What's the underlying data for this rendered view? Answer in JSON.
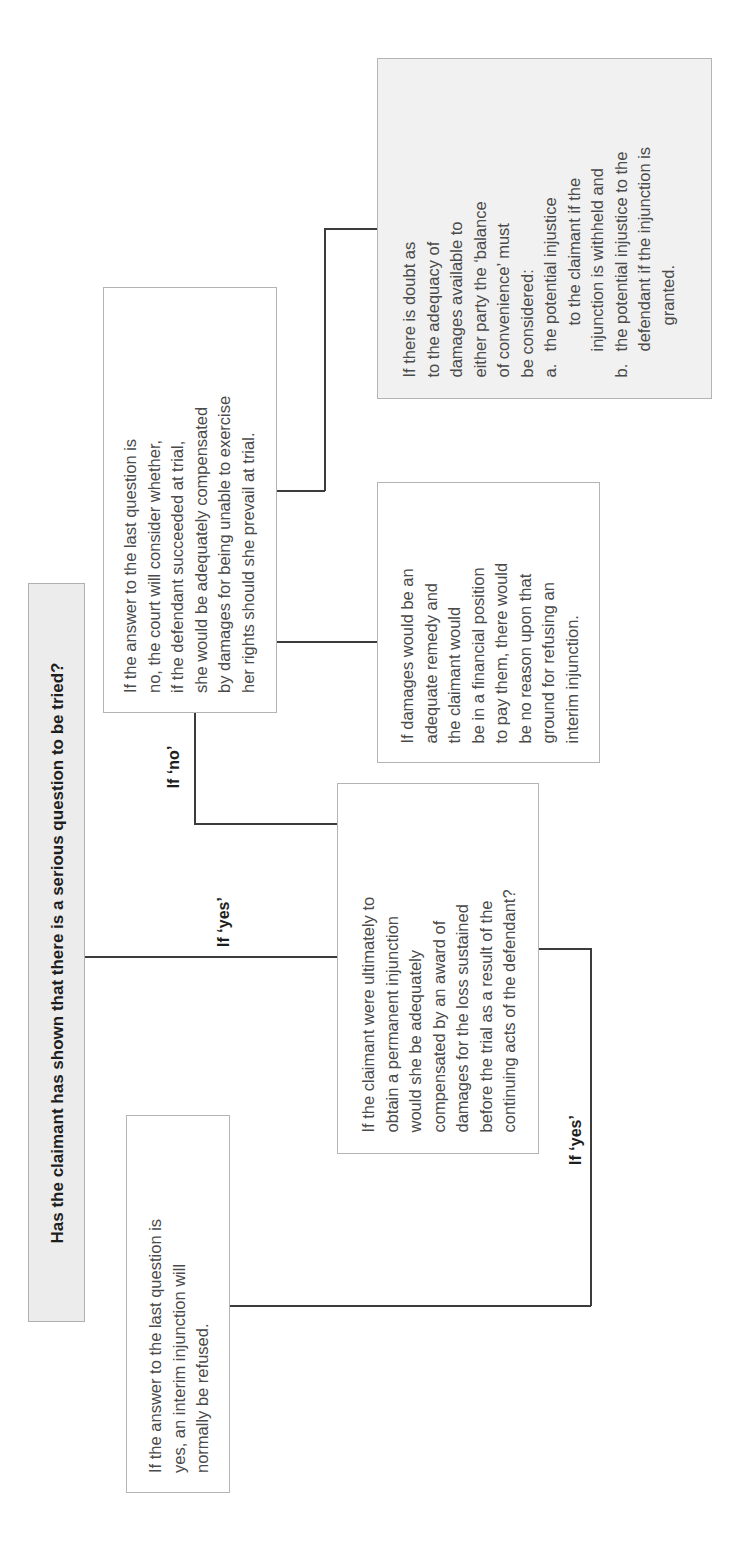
{
  "diagram": {
    "orientation": "rotated 90 degrees counter-clockwise; text reads bottom-to-top",
    "title": "Has the claimant has shown that there is a serious question to be tried?",
    "branch_labels": {
      "title_to_question": "If ‘yes’",
      "question_to_no_box": "If ‘no’",
      "question_to_refused": "If ‘yes’"
    },
    "boxes": {
      "damages_question": {
        "lines": [
          "If the claimant were ultimately to",
          "obtain a permanent injunction",
          "would she be adequately",
          "compensated by an award of",
          "damages for the loss sustained",
          "before the trial as a result of the",
          "continuing acts of the defendant?"
        ]
      },
      "refused": {
        "lines": [
          "If the answer to the last question is",
          "yes, an interim injunction will",
          "normally be refused."
        ]
      },
      "answer_no": {
        "lines": [
          "If the answer to the last question is",
          "no, the court will consider whether,",
          "if the defendant succeeded at trial,",
          "she would be adequately compensated",
          "by damages for being unable to exercise",
          "her rights should she prevail at trial."
        ]
      },
      "damages_adequate": {
        "lines": [
          "If damages would be an",
          "adequate remedy and",
          "the claimant would",
          "be in a financial position",
          "to pay them, there would",
          "be no reason upon that",
          "ground for refusing an",
          "interim injunction."
        ]
      },
      "balance_of_convenience": {
        "intro_lines": [
          "If there is doubt as",
          "to the adequacy of",
          "damages available to",
          "either party the ‘balance",
          "of convenience’ must",
          "be considered:"
        ],
        "items": [
          {
            "marker": "a.",
            "lines": [
              "the potential injustice",
              "to the claimant if the",
              "injunction is withheld and"
            ]
          },
          {
            "marker": "b.",
            "lines": [
              "the potential injustice to the",
              "defendant if the injunction is",
              "granted."
            ]
          }
        ]
      }
    },
    "colors": {
      "text": "#4a4a4a",
      "title_text": "#1e1e1e",
      "border": "#b4b4b4",
      "connector": "#3c3c3c",
      "shaded_fill": "#f1f1f1"
    }
  }
}
